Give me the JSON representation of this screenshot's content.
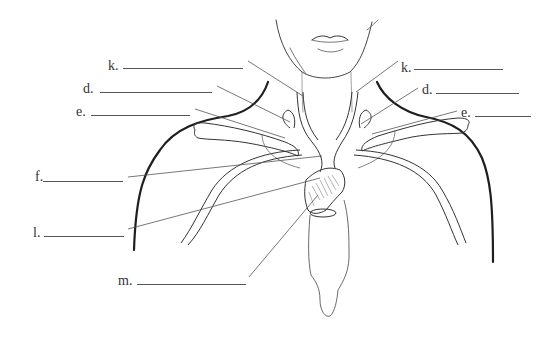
{
  "diagram": {
    "type": "anatomical-label-worksheet",
    "colors": {
      "outline": "#222222",
      "vessel": "#3a3a3a",
      "leader": "#555555",
      "label_text": "#333333",
      "background": "#ffffff"
    },
    "labels": [
      {
        "id": "k-left",
        "text": "k.",
        "side": "left",
        "x": 108,
        "y": 59,
        "blank_x1": 123,
        "blank_x2": 243,
        "blank_y": 68,
        "leader": [
          [
            248,
            61
          ],
          [
            303,
            96
          ]
        ]
      },
      {
        "id": "d-left",
        "text": "d.",
        "side": "left",
        "x": 83,
        "y": 82,
        "blank_x1": 100,
        "blank_x2": 212,
        "blank_y": 92,
        "leader": [
          [
            217,
            86
          ],
          [
            290,
            122
          ]
        ]
      },
      {
        "id": "e-left",
        "text": "e.",
        "side": "left",
        "x": 76,
        "y": 105,
        "blank_x1": 91,
        "blank_x2": 190,
        "blank_y": 115,
        "leader": [
          [
            195,
            109
          ],
          [
            285,
            138
          ]
        ]
      },
      {
        "id": "f-left",
        "text": "f.",
        "side": "left",
        "x": 35,
        "y": 170,
        "blank_x1": 43,
        "blank_x2": 123,
        "blank_y": 181,
        "leader": [
          [
            128,
            177
          ],
          [
            322,
            156
          ]
        ]
      },
      {
        "id": "l-left",
        "text": "l.",
        "side": "left",
        "x": 33,
        "y": 226,
        "blank_x1": 44,
        "blank_x2": 124,
        "blank_y": 236,
        "leader": [
          [
            128,
            229
          ],
          [
            320,
            178
          ]
        ]
      },
      {
        "id": "m-left",
        "text": "m.",
        "side": "left",
        "x": 118,
        "y": 274,
        "blank_x1": 137,
        "blank_x2": 246,
        "blank_y": 284,
        "leader": [
          [
            249,
            277
          ],
          [
            318,
            195
          ]
        ]
      },
      {
        "id": "k-right",
        "text": "k.",
        "side": "right",
        "x": 401,
        "y": 61,
        "blank_x1": 414,
        "blank_x2": 503,
        "blank_y": 69,
        "leader": [
          [
            398,
            61
          ],
          [
            356,
            92
          ]
        ]
      },
      {
        "id": "d-right",
        "text": "d.",
        "side": "right",
        "x": 422,
        "y": 83,
        "blank_x1": 436,
        "blank_x2": 519,
        "blank_y": 93,
        "leader": [
          [
            418,
            88
          ],
          [
            361,
            124
          ]
        ]
      },
      {
        "id": "e-right",
        "text": "e.",
        "side": "right",
        "x": 461,
        "y": 106,
        "blank_x1": 475,
        "blank_x2": 531,
        "blank_y": 116,
        "leader": [
          [
            457,
            111
          ],
          [
            372,
            134
          ]
        ]
      }
    ]
  }
}
